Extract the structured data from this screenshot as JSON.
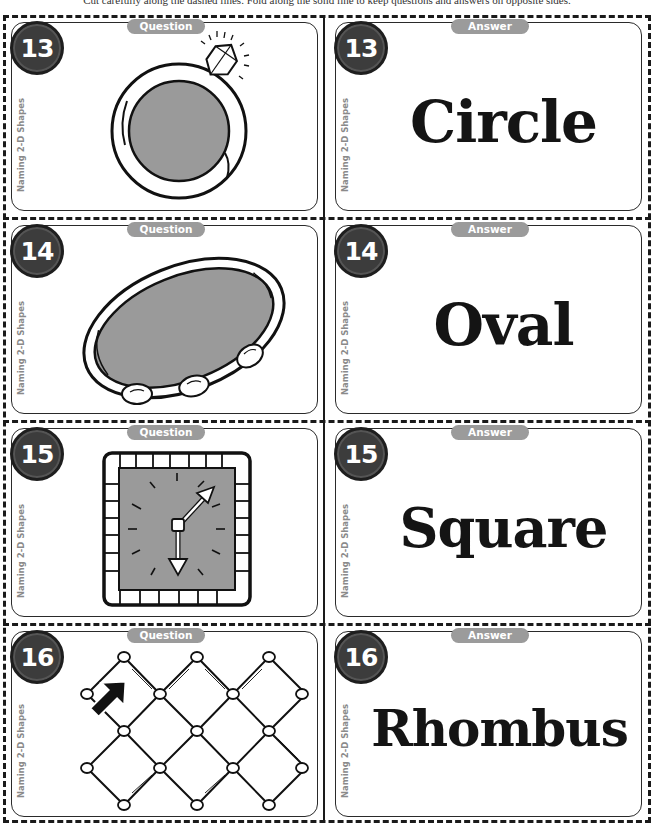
{
  "instructions": "Cut carefully along the dashed lines. Fold along the solid line to keep questions and answers on opposite sides.",
  "colors": {
    "border": "#1a1a1a",
    "number_circle": "#3c3c3c",
    "pill": "#9b9b9b",
    "shape_fill": "#9a9a9a",
    "side_label": "#8a8a8a"
  },
  "side_label": "Naming 2-D Shapes",
  "cards": [
    {
      "number": "13",
      "question": {
        "pill": "Question",
        "image": "ring-icon"
      },
      "answer": {
        "pill": "Answer",
        "word": "Circle"
      }
    },
    {
      "number": "14",
      "question": {
        "pill": "Question",
        "image": "tambourine-icon"
      },
      "answer": {
        "pill": "Answer",
        "word": "Oval"
      }
    },
    {
      "number": "15",
      "question": {
        "pill": "Question",
        "image": "square-clock-icon"
      },
      "answer": {
        "pill": "Answer",
        "word": "Square"
      }
    },
    {
      "number": "16",
      "question": {
        "pill": "Question",
        "image": "chain-link-fence-icon"
      },
      "answer": {
        "pill": "Answer",
        "word": "Rhombus"
      }
    }
  ]
}
